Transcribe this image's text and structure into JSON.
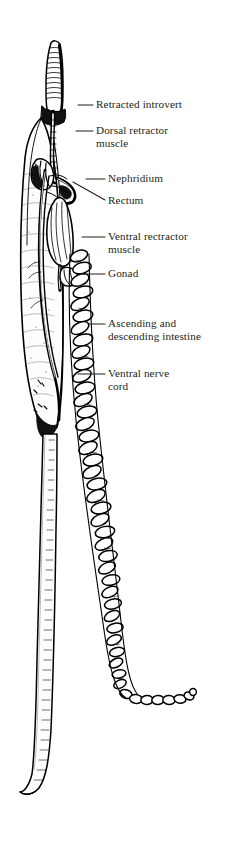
{
  "figure": {
    "background_color": "#ffffff",
    "ink_color": "#000000",
    "text_color": "#231f20",
    "width": 244,
    "height": 856
  },
  "labels": [
    {
      "id": "retracted-introvert",
      "text": "Retracted introvert",
      "x": 96,
      "y": 98,
      "leader": {
        "x1": 78,
        "y1": 105,
        "x2": 93,
        "y2": 105
      }
    },
    {
      "id": "dorsal-retractor",
      "text": "Dorsal retractor",
      "x": 96,
      "y": 124,
      "leader": {
        "x1": 76,
        "y1": 131,
        "x2": 93,
        "y2": 131
      }
    },
    {
      "id": "dorsal-retractor-2",
      "text": "muscle",
      "x": 96,
      "y": 137,
      "leader": null
    },
    {
      "id": "nephridium",
      "text": "Nephridium",
      "x": 108,
      "y": 172,
      "leader": {
        "x1": 86,
        "y1": 179,
        "x2": 105,
        "y2": 179
      }
    },
    {
      "id": "rectum",
      "text": "Rectum",
      "x": 108,
      "y": 194,
      "leader": {
        "x1": 73,
        "y1": 182,
        "x2": 105,
        "y2": 200
      }
    },
    {
      "id": "ventral-retractor",
      "text": "Ventral rectractor",
      "x": 108,
      "y": 230,
      "leader": {
        "x1": 82,
        "y1": 237,
        "x2": 105,
        "y2": 237
      }
    },
    {
      "id": "ventral-retractor-2",
      "text": "muscle",
      "x": 108,
      "y": 243,
      "leader": null
    },
    {
      "id": "gonad",
      "text": "Gonad",
      "x": 108,
      "y": 267,
      "leader": {
        "x1": 82,
        "y1": 274,
        "x2": 105,
        "y2": 274
      }
    },
    {
      "id": "ascending-intestine",
      "text": "Ascending and",
      "x": 108,
      "y": 317,
      "leader": {
        "x1": 88,
        "y1": 324,
        "x2": 105,
        "y2": 324
      }
    },
    {
      "id": "descending-intestine",
      "text": "descending intestine",
      "x": 108,
      "y": 330,
      "leader": null
    },
    {
      "id": "ventral-nerve-cord",
      "text": "Ventral nerve",
      "x": 108,
      "y": 367,
      "leader": {
        "x1": 78,
        "y1": 374,
        "x2": 105,
        "y2": 374
      }
    },
    {
      "id": "ventral-nerve-cord-2",
      "text": "cord",
      "x": 108,
      "y": 380,
      "leader": null
    }
  ],
  "structures": [
    {
      "id": "introvert",
      "name": "Retracted introvert"
    },
    {
      "id": "trunk",
      "name": "Body trunk wall"
    },
    {
      "id": "dorsal-retractor",
      "name": "Dorsal retractor muscle"
    },
    {
      "id": "ventral-retractor",
      "name": "Ventral retractor muscle"
    },
    {
      "id": "nephridium",
      "name": "Nephridium"
    },
    {
      "id": "rectum",
      "name": "Rectum"
    },
    {
      "id": "gonad",
      "name": "Gonad"
    },
    {
      "id": "intestine-coil",
      "name": "Ascending and descending intestine spiral"
    },
    {
      "id": "nerve-cord",
      "name": "Ventral nerve cord"
    },
    {
      "id": "tail",
      "name": "Posterior trunk / tail"
    }
  ]
}
